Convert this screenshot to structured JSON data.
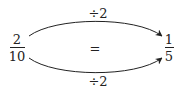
{
  "left_fraction": {
    "numerator": "2",
    "denominator": "10"
  },
  "right_fraction": {
    "numerator": "1",
    "denominator": "5"
  },
  "equals": "=",
  "top_arrow": {
    "label": "÷2"
  },
  "bottom_arrow": {
    "label": "÷2"
  },
  "colors": {
    "ink": "#222222",
    "background": "#ffffff"
  }
}
